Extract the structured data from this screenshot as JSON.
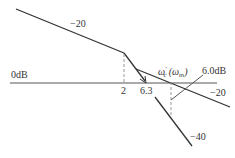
{
  "diagram": {
    "type": "bode-asymptotic-magnitude",
    "axis_label": "0dB",
    "slope_labels": {
      "upper_left": "−20",
      "right": "−20",
      "lower": "−40"
    },
    "frequency_marks": {
      "corner_1": "2",
      "corner_2": "6.3"
    },
    "crossover_label_main": "ω",
    "crossover_label_sup": "′",
    "crossover_label_sub": "c",
    "crossover_paren_main": "(ω",
    "crossover_paren_sub": "m",
    "crossover_paren_close": ")",
    "gain_annotation": "6.0dB",
    "colors": {
      "line": "#333333",
      "axis": "#555555",
      "dashed": "#999999",
      "text": "#333333"
    }
  }
}
